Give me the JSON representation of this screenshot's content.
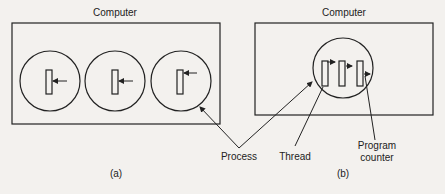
{
  "panel_a": {
    "computer_label": "Computer",
    "caption": "(a)",
    "process_count": 3,
    "threads_per_process": 1
  },
  "panel_b": {
    "computer_label": "Computer",
    "caption": "(b)",
    "process_count": 1,
    "threads_per_process": 3
  },
  "labels": {
    "process": "Process",
    "thread": "Thread",
    "program_counter_line1": "Program",
    "program_counter_line2": "counter"
  },
  "colors": {
    "ink": "#222222",
    "paper": "#f3f1ee"
  }
}
